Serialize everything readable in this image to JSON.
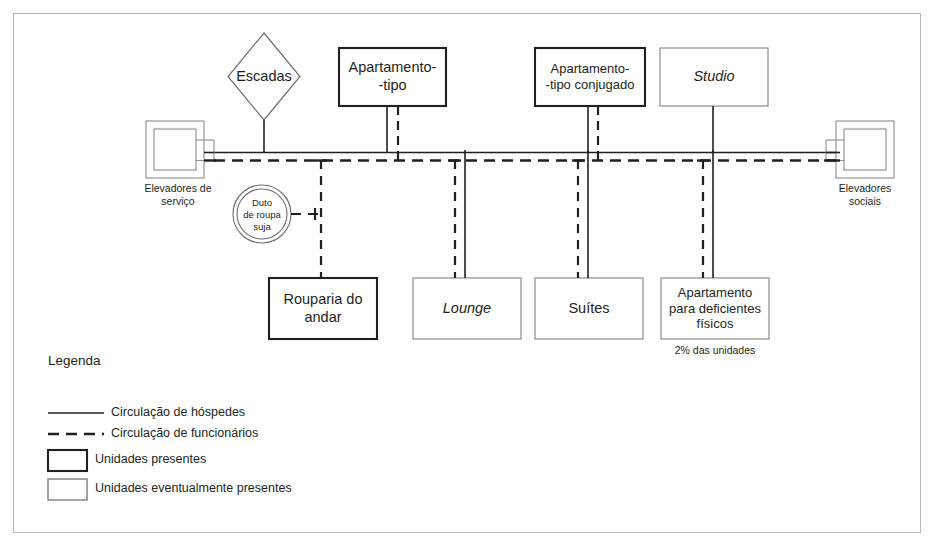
{
  "diagram": {
    "title_hidden": "",
    "colors": {
      "ink": "#231f20",
      "strong_border": "#231f20",
      "light_border": "#8d8d8d",
      "frame": "#b9b9b9",
      "corridor": "#231f20"
    },
    "nodes": [
      {
        "id": "escadas",
        "label": "Escadas",
        "shape": "diamond",
        "style": "light",
        "italic": false,
        "circulation": [
          "guests"
        ]
      },
      {
        "id": "apartamento-tipo",
        "label": "Apartamento-\n-tipo",
        "line1": "Apartamento-",
        "line2": "-tipo",
        "shape": "rect",
        "style": "strong",
        "italic": false,
        "circulation": [
          "guests",
          "staff"
        ]
      },
      {
        "id": "apartamento-tipo-conjugado",
        "label": "Apartamento-\n-tipo conjugado",
        "line1": "Apartamento-",
        "line2": "-tipo conjugado",
        "shape": "rect",
        "style": "strong",
        "italic": false,
        "circulation": [
          "guests",
          "staff"
        ]
      },
      {
        "id": "studio",
        "label": "Studio",
        "shape": "rect",
        "style": "light",
        "italic": true,
        "circulation": [
          "guests"
        ]
      },
      {
        "id": "elevadores-servico",
        "label": "Elevadores de\nserviço",
        "line1": "Elevadores de",
        "line2": "serviço",
        "shape": "elevator",
        "style": "light",
        "italic": false,
        "circulation": [
          "guests",
          "staff"
        ]
      },
      {
        "id": "elevadores-sociais",
        "label": "Elevadores\nsociais",
        "line1": "Elevadores",
        "line2": "sociais",
        "shape": "elevator",
        "style": "light",
        "italic": false,
        "circulation": [
          "guests",
          "staff"
        ]
      },
      {
        "id": "duto-roupa-suja",
        "label": "Duto\nde roupa\nsuja",
        "line1": "Duto",
        "line2": "de roupa",
        "line3": "suja",
        "shape": "double-circle",
        "style": "light",
        "italic": false,
        "circulation": [
          "staff"
        ]
      },
      {
        "id": "rouparia-do-andar",
        "label": "Rouparia do\nandar",
        "line1": "Rouparia do",
        "line2": "andar",
        "shape": "rect",
        "style": "strong",
        "italic": false,
        "circulation": [
          "staff"
        ]
      },
      {
        "id": "lounge",
        "label": "Lounge",
        "shape": "rect",
        "style": "light",
        "italic": true,
        "circulation": [
          "guests",
          "staff"
        ]
      },
      {
        "id": "suites",
        "label": "Suítes",
        "shape": "rect",
        "style": "light",
        "italic": false,
        "circulation": [
          "guests",
          "staff"
        ]
      },
      {
        "id": "apartamento-deficientes",
        "label": "Apartamento\npara deficientes\nfísicos",
        "line1": "Apartamento",
        "line2": "para deficientes",
        "line3": "físicos",
        "shape": "rect",
        "style": "light",
        "italic": false,
        "note": "2% das unidades",
        "circulation": [
          "guests",
          "staff"
        ]
      }
    ]
  },
  "legend": {
    "title": "Legenda",
    "items": [
      {
        "key": "guest-circulation",
        "symbol": "solid-line",
        "label": "Circulação de hóspedes"
      },
      {
        "key": "staff-circulation",
        "symbol": "dashed-line",
        "label": "Circulação de funcionários"
      },
      {
        "key": "units-present",
        "symbol": "strong-box",
        "label": "Unidades presentes"
      },
      {
        "key": "units-eventual",
        "symbol": "light-box",
        "label": "Unidades eventualmente presentes"
      }
    ]
  }
}
